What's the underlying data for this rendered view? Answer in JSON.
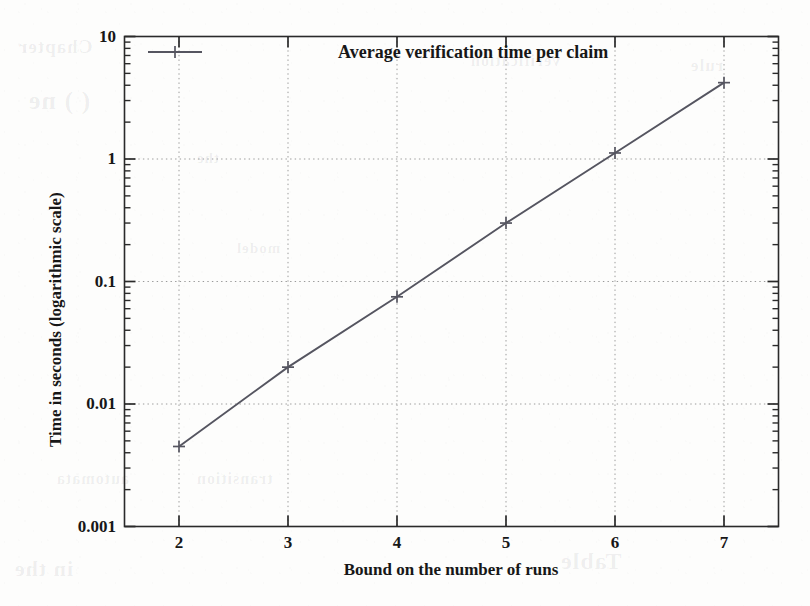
{
  "figure": {
    "background_color": "#fdfdfc",
    "ink_color": "#1b1b1b",
    "line_color": "#555560",
    "grid_color": "#9a9a9a"
  },
  "legend": {
    "entry_label": "Average verification time per claim",
    "key_marker": "plus-marker"
  },
  "axes": {
    "x_title": "Bound on the number of runs",
    "y_title": "Time in seconds (logarithmic scale)",
    "x_ticks": [
      "2",
      "3",
      "4",
      "5",
      "6",
      "7"
    ],
    "y_ticks": [
      "10",
      "1",
      "0.1",
      "0.01",
      "0.001"
    ]
  },
  "ghost_text": [
    {
      "text": "Chapter",
      "x": 18,
      "y": 36,
      "size": 19
    },
    {
      "text": "( ) ne",
      "x": 28,
      "y": 86,
      "size": 26
    },
    {
      "text": "verification",
      "x": 470,
      "y": 52,
      "size": 16
    },
    {
      "text": "rule",
      "x": 690,
      "y": 56,
      "size": 17
    },
    {
      "text": "the",
      "x": 196,
      "y": 150,
      "size": 15
    },
    {
      "text": "model",
      "x": 236,
      "y": 240,
      "size": 15
    },
    {
      "text": "automata",
      "x": 56,
      "y": 470,
      "size": 16
    },
    {
      "text": "transition",
      "x": 196,
      "y": 470,
      "size": 16
    },
    {
      "text": "in the",
      "x": 14,
      "y": 556,
      "size": 22
    },
    {
      "text": "Table",
      "x": 560,
      "y": 548,
      "size": 24
    }
  ],
  "chart_data": {
    "type": "line",
    "title": "",
    "xlabel": "Bound on the number of runs",
    "ylabel": "Time in seconds (logarithmic scale)",
    "yscale": "log",
    "xscale": "linear",
    "xlim": [
      1.5,
      7.5
    ],
    "ylim": [
      0.001,
      10
    ],
    "grid": true,
    "grid_style": "dotted",
    "legend_position": "top-center",
    "x": [
      2,
      3,
      4,
      5,
      6,
      7
    ],
    "series": [
      {
        "name": "Average verification time per claim",
        "marker": "plus",
        "values": [
          0.0045,
          0.02,
          0.075,
          0.3,
          1.12,
          4.2
        ]
      }
    ]
  }
}
